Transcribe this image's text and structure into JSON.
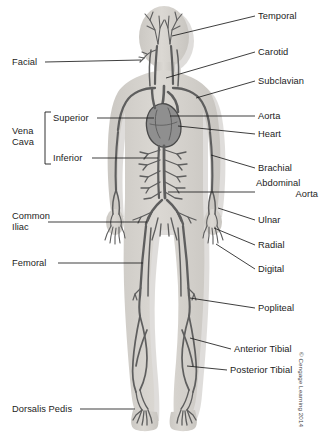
{
  "figure": {
    "copyright": "© Cengage Learning 2014",
    "colors": {
      "background": "#ffffff",
      "body_silhouette": "#d6d3ce",
      "body_shadow": "#c3c0bb",
      "vessel_dark": "#5e5e5e",
      "vessel_mid": "#7c7c7c",
      "vessel_light": "#9a9a9a",
      "heart_fill": "#8a8a8a",
      "heart_outline": "#4a4a4a",
      "leader_line": "#1c1c1c",
      "label_text": "#1c1c1c"
    }
  },
  "labels": {
    "right": [
      {
        "id": "temporal",
        "text": "Temporal",
        "x": 258,
        "y": 11
      },
      {
        "id": "carotid",
        "text": "Carotid",
        "x": 258,
        "y": 47
      },
      {
        "id": "subclavian",
        "text": "Subclavian",
        "x": 258,
        "y": 76
      },
      {
        "id": "aorta",
        "text": "Aorta",
        "x": 258,
        "y": 111
      },
      {
        "id": "heart",
        "text": "Heart",
        "x": 258,
        "y": 129
      },
      {
        "id": "brachial",
        "text": "Brachial",
        "x": 258,
        "y": 163
      },
      {
        "id": "ulnar",
        "text": "Ulnar",
        "x": 258,
        "y": 215
      },
      {
        "id": "radial",
        "text": "Radial",
        "x": 258,
        "y": 240
      },
      {
        "id": "digital",
        "text": "Digital",
        "x": 258,
        "y": 264
      },
      {
        "id": "popliteal",
        "text": "Popliteal",
        "x": 258,
        "y": 303
      },
      {
        "id": "anterior-tibial",
        "text": "Anterior Tibial",
        "x": 234,
        "y": 344
      },
      {
        "id": "posterior-tibial",
        "text": "Posterior Tibial",
        "x": 230,
        "y": 365
      }
    ],
    "abdominal_aorta": {
      "id": "abdominal-aorta",
      "line1": "Abdominal",
      "line2": "Aorta",
      "x": 258,
      "y": 182
    },
    "left": [
      {
        "id": "facial",
        "text": "Facial",
        "x": 12,
        "y": 57
      },
      {
        "id": "femoral",
        "text": "Femoral",
        "x": 12,
        "y": 258
      },
      {
        "id": "dorsalis-pedis",
        "text": "Dorsalis Pedis",
        "x": 12,
        "y": 404
      }
    ],
    "common_iliac": {
      "id": "common-iliac",
      "line1": "Common",
      "line2": "Iliac",
      "x": 12,
      "y": 211
    },
    "vena_cava": {
      "id": "vena-cava",
      "group_line1": "Vena",
      "group_line2": "Cava",
      "group_x": 12,
      "group_y": 126,
      "items": [
        {
          "id": "superior",
          "text": "Superior",
          "x": 53,
          "y": 113
        },
        {
          "id": "inferior",
          "text": "Inferior",
          "x": 53,
          "y": 153
        }
      ]
    }
  }
}
